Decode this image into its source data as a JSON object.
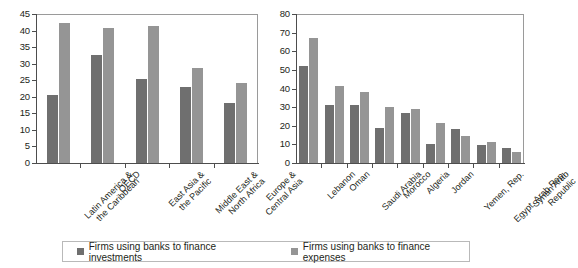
{
  "legend": {
    "items": [
      {
        "label": "Firms using banks to finance investments",
        "color": "#6f6f6f",
        "key": "investments"
      },
      {
        "label": "Firms using banks to finance expenses",
        "color": "#959595",
        "key": "expenses"
      }
    ]
  },
  "chart_data": [
    {
      "type": "bar",
      "title": "",
      "xlabel": "",
      "ylabel": "",
      "ylim": [
        0,
        45
      ],
      "yticks": [
        0,
        5,
        10,
        15,
        20,
        25,
        30,
        35,
        40,
        45
      ],
      "grid": false,
      "legend_position": "bottom",
      "categories": [
        "Latin America & the Caribbean",
        "OECD",
        "East Asia & the Pacific",
        "Middle East & North Africa",
        "Europe & Central Asia"
      ],
      "series": [
        {
          "name": "Firms using banks to finance investments",
          "color": "#6f6f6f",
          "values": [
            20.5,
            32.5,
            25.4,
            23.0,
            18.0
          ]
        },
        {
          "name": "Firms using banks to finance expenses",
          "color": "#959595",
          "values": [
            42.2,
            40.9,
            41.5,
            28.8,
            24.2
          ]
        }
      ]
    },
    {
      "type": "bar",
      "title": "",
      "xlabel": "",
      "ylabel": "",
      "ylim": [
        0,
        80
      ],
      "yticks": [
        0,
        10,
        20,
        30,
        40,
        50,
        60,
        70,
        80
      ],
      "grid": false,
      "legend_position": "bottom",
      "categories": [
        "Lebanon",
        "Oman",
        "Saudi Arabia",
        "Morocco",
        "Algeria",
        "Jordan",
        "Yemen, Rep.",
        "Egypt, Arab Rep.",
        "Syrian Arab Republic"
      ],
      "series": [
        {
          "name": "Firms using banks to finance investments",
          "color": "#6f6f6f",
          "values": [
            52.2,
            31.0,
            31.1,
            19.0,
            27.0,
            10.4,
            18.3,
            9.5,
            8.1
          ]
        },
        {
          "name": "Firms using banks to finance expenses",
          "color": "#959595",
          "values": [
            67.0,
            41.1,
            38.0,
            30.1,
            28.8,
            21.5,
            14.6,
            11.3,
            5.9
          ]
        }
      ]
    }
  ]
}
